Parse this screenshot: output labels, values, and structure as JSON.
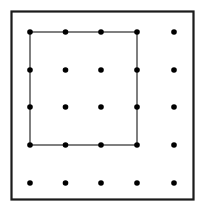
{
  "figure": {
    "canvas": {
      "width": 206,
      "height": 211,
      "background_color": "#ffffff"
    },
    "outer_frame": {
      "label": "outer border rectangle",
      "x": 11.5,
      "y": 11.5,
      "width": 182,
      "height": 188,
      "stroke_color": "#1a1a1a",
      "stroke_width": 2.2,
      "fill": "none"
    },
    "inner_square": {
      "label": "inscribed square through lattice points",
      "x": 30,
      "y": 32,
      "width": 107,
      "height": 113,
      "stroke_color": "#2b2b2b",
      "stroke_width": 1.2,
      "fill": "none"
    }
  },
  "chart_data": {
    "type": "scatter",
    "title": "",
    "xlabel": "",
    "ylabel": "",
    "grid": false,
    "legend": null,
    "xlim": [
      0,
      4
    ],
    "ylim": [
      0,
      4
    ],
    "columns_px": [
      30,
      65.5,
      101,
      137,
      174
    ],
    "rows_px": [
      32,
      70,
      107,
      145,
      183
    ],
    "dot_color": "#000000",
    "dot_radius_px": 2.8,
    "series": [
      {
        "name": "lattice points",
        "x": [
          0,
          1,
          2,
          3,
          4,
          0,
          1,
          2,
          3,
          4,
          0,
          1,
          2,
          3,
          4,
          0,
          1,
          2,
          3,
          4,
          0,
          1,
          2,
          3,
          4
        ],
        "y": [
          4,
          4,
          4,
          4,
          4,
          3,
          3,
          3,
          3,
          3,
          2,
          2,
          2,
          2,
          2,
          1,
          1,
          1,
          1,
          1,
          0,
          0,
          0,
          0,
          0
        ],
        "points_px": [
          [
            30,
            32
          ],
          [
            65.5,
            32
          ],
          [
            101,
            32
          ],
          [
            137,
            32
          ],
          [
            174,
            32
          ],
          [
            30,
            70
          ],
          [
            65.5,
            70
          ],
          [
            101,
            70
          ],
          [
            137,
            70
          ],
          [
            174,
            70
          ],
          [
            30,
            107
          ],
          [
            65.5,
            107
          ],
          [
            101,
            107
          ],
          [
            137,
            107
          ],
          [
            174,
            107
          ],
          [
            30,
            145
          ],
          [
            65.5,
            145
          ],
          [
            101,
            145
          ],
          [
            137,
            145
          ],
          [
            174,
            145
          ],
          [
            30,
            183
          ],
          [
            65.5,
            183
          ],
          [
            101,
            183
          ],
          [
            137,
            183
          ],
          [
            174,
            183
          ]
        ]
      }
    ],
    "annotations": [
      {
        "name": "inscribed-square",
        "type": "polygon",
        "vertices_px": [
          [
            30,
            32
          ],
          [
            137,
            32
          ],
          [
            137,
            145
          ],
          [
            30,
            145
          ]
        ],
        "vertices_grid": [
          [
            0,
            4
          ],
          [
            3,
            4
          ],
          [
            3,
            1
          ],
          [
            0,
            1
          ]
        ],
        "stroke_color": "#2b2b2b"
      },
      {
        "name": "outer-frame",
        "type": "rect",
        "vertices_px": [
          [
            11.5,
            11.5
          ],
          [
            193.5,
            11.5
          ],
          [
            193.5,
            199.5
          ],
          [
            11.5,
            199.5
          ]
        ],
        "stroke_color": "#1a1a1a"
      }
    ]
  }
}
